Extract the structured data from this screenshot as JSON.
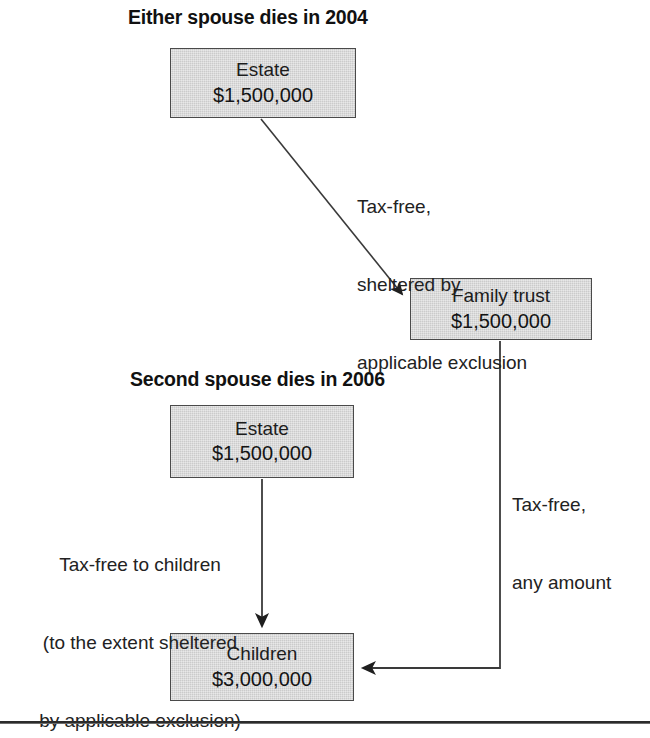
{
  "figure": {
    "kind": "flow-diagram",
    "title_sections": [
      "Either spouse dies in 2004",
      "Second spouse dies in 2006"
    ],
    "colors": {
      "box_fill": "#d6d6d6",
      "box_border": "#4a4a4a",
      "text": "#1a1a1a",
      "connector": "#333333",
      "rule": "#2b2b2b"
    }
  },
  "sections": {
    "first": {
      "heading": "Either spouse dies in 2004"
    },
    "second": {
      "heading": "Second spouse dies in 2006"
    }
  },
  "nodes": {
    "estate_2004": {
      "title": "Estate",
      "amount": "$1,500,000"
    },
    "family_trust": {
      "title": "Family trust",
      "amount": "$1,500,000"
    },
    "estate_2006": {
      "title": "Estate",
      "amount": "$1,500,000"
    },
    "children": {
      "title": "Children",
      "amount": "$3,000,000"
    }
  },
  "edges": {
    "estate_to_trust": {
      "label_line_1": "Tax-free,",
      "label_line_2": "sheltered by",
      "label_line_3": "applicable exclusion"
    },
    "trust_to_children": {
      "label_line_1": "Tax-free,",
      "label_line_2": "any amount"
    },
    "estate2006_to_children": {
      "label_line_1": "Tax-free to children",
      "label_line_2": "(to the extent sheltered",
      "label_line_3": "by applicable exclusion)"
    }
  }
}
